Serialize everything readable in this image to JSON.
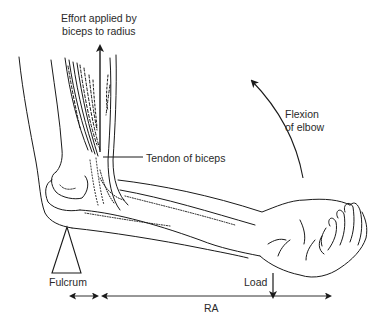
{
  "diagram": {
    "labels": {
      "effort_line1": "Effort applied by",
      "effort_line2": "biceps to radius",
      "flexion_line1": "Flexion",
      "flexion_line2": "of elbow",
      "tendon": "Tendon of biceps",
      "fulcrum": "Fulcrum",
      "load": "Load",
      "ra": "RA"
    },
    "icons": {
      "effort_arrow": "arrow-up",
      "flexion_arrow": "curved-arrow-up-left",
      "load_arrow": "arrow-down",
      "fulcrum": "triangle",
      "effort_arm_dimension": "double-arrow-horizontal",
      "resistance_arm_dimension": "double-arrow-horizontal"
    },
    "colors": {
      "line": "#1a1a1a",
      "text": "#2a2a2a",
      "background": "#ffffff"
    }
  }
}
